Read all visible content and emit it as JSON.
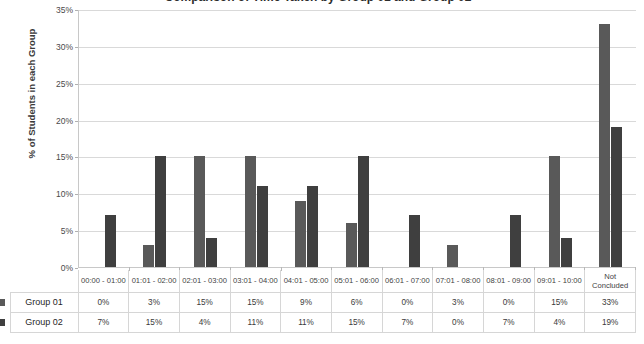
{
  "chart_data": {
    "type": "bar",
    "title": "Comparison of Time Taken by Group 01 and Group 02",
    "xlabel": "",
    "ylabel": "% of Students in each Group",
    "ylim": [
      0,
      35
    ],
    "ytick_labels": [
      "0%",
      "5%",
      "10%",
      "15%",
      "20%",
      "25%",
      "30%",
      "35%"
    ],
    "ytick_values": [
      0,
      5,
      10,
      15,
      20,
      25,
      30,
      35
    ],
    "grid": true,
    "legend_position": "table-row-labels",
    "categories": [
      "00:00 - 01:00",
      "01:01 - 02:00",
      "02:01 - 03:00",
      "03:01 - 04:00",
      "04:01 - 05:00",
      "05:01 - 06:00",
      "06:01 - 07:00",
      "07:01 - 08:00",
      "08:01 - 09:00",
      "09:01 - 10:00",
      "Not Concluded"
    ],
    "series": [
      {
        "name": "Group 01",
        "color": "#595959",
        "values": [
          0,
          3,
          15,
          15,
          9,
          6,
          0,
          3,
          0,
          15,
          33
        ],
        "labels": [
          "0%",
          "3%",
          "15%",
          "15%",
          "9%",
          "6%",
          "0%",
          "3%",
          "0%",
          "15%",
          "33%"
        ]
      },
      {
        "name": "Group 02",
        "color": "#3f3f3f",
        "values": [
          7,
          15,
          4,
          11,
          11,
          15,
          7,
          0,
          7,
          4,
          19
        ],
        "labels": [
          "7%",
          "15%",
          "4%",
          "11%",
          "11%",
          "15%",
          "7%",
          "0%",
          "7%",
          "4%",
          "19%"
        ]
      }
    ]
  },
  "table": {
    "row_key_icon": "legend-swatch"
  }
}
